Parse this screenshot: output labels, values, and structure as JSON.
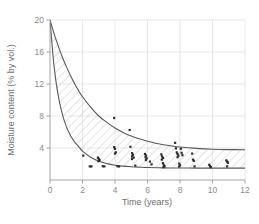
{
  "chart_data": {
    "type": "line",
    "title": "",
    "xlabel": "Time (years)",
    "ylabel": "Moisture content (% by vol.)",
    "xlim": [
      0,
      12
    ],
    "ylim": [
      0,
      20
    ],
    "xticks": [
      0,
      2,
      4,
      6,
      8,
      10,
      12
    ],
    "xtick_labels": [
      "0",
      "2",
      "4",
      "6",
      "8",
      "10",
      "12"
    ],
    "yticks": [
      0,
      4,
      8,
      12,
      16,
      20
    ],
    "ytick_labels": [
      "",
      "4",
      "8",
      "12",
      "16",
      "20"
    ],
    "grid": true,
    "legend": "none",
    "band_fill": "hatched",
    "series": [
      {
        "name": "upper bound",
        "type": "line",
        "color": "#595959",
        "x": [
          0,
          0.25,
          0.5,
          0.75,
          1,
          1.25,
          1.5,
          1.75,
          2,
          2.5,
          3,
          3.5,
          4,
          4.5,
          5,
          5.5,
          6,
          6.5,
          7,
          7.5,
          8,
          9,
          10,
          11,
          12
        ],
        "y": [
          20.0,
          18.3,
          16.8,
          15.4,
          14.2,
          13.1,
          12.1,
          11.2,
          10.4,
          9.1,
          8.0,
          7.2,
          6.5,
          5.95,
          5.5,
          5.15,
          4.85,
          4.6,
          4.4,
          4.25,
          4.12,
          3.95,
          3.85,
          3.8,
          3.78
        ]
      },
      {
        "name": "lower bound",
        "type": "line",
        "color": "#595959",
        "x": [
          0,
          0.25,
          0.5,
          0.75,
          1,
          1.25,
          1.5,
          1.75,
          2,
          2.5,
          3,
          3.5,
          4,
          4.5,
          5,
          5.5,
          6,
          7,
          8,
          9,
          10,
          11,
          12
        ],
        "y": [
          20.0,
          14.2,
          10.6,
          8.3,
          6.7,
          5.6,
          4.8,
          4.2,
          3.6,
          2.85,
          2.35,
          2.05,
          1.85,
          1.73,
          1.65,
          1.6,
          1.56,
          1.52,
          1.5,
          1.49,
          1.48,
          1.48,
          1.48
        ]
      },
      {
        "name": "measurements",
        "type": "scatter",
        "color": "#2b2b2b",
        "points": [
          [
            2.05,
            3.05
          ],
          [
            2.45,
            1.7
          ],
          [
            2.55,
            1.7
          ],
          [
            2.95,
            2.8
          ],
          [
            3.0,
            2.65
          ],
          [
            3.05,
            2.5
          ],
          [
            2.98,
            2.35
          ],
          [
            3.25,
            1.72
          ],
          [
            3.35,
            1.7
          ],
          [
            3.95,
            7.75
          ],
          [
            3.95,
            4.1
          ],
          [
            4.0,
            3.9
          ],
          [
            4.05,
            3.45
          ],
          [
            4.0,
            3.3
          ],
          [
            4.15,
            1.72
          ],
          [
            4.25,
            1.7
          ],
          [
            4.9,
            6.25
          ],
          [
            4.95,
            4.15
          ],
          [
            5.05,
            3.35
          ],
          [
            5.1,
            3.15
          ],
          [
            5.05,
            2.95
          ],
          [
            5.15,
            2.8
          ],
          [
            5.05,
            2.62
          ],
          [
            5.25,
            1.8
          ],
          [
            5.85,
            3.25
          ],
          [
            5.9,
            3.05
          ],
          [
            5.88,
            2.85
          ],
          [
            5.95,
            2.7
          ],
          [
            5.9,
            2.5
          ],
          [
            6.15,
            2.3
          ],
          [
            6.25,
            1.95
          ],
          [
            6.85,
            3.2
          ],
          [
            6.9,
            2.95
          ],
          [
            6.95,
            2.75
          ],
          [
            6.88,
            2.55
          ],
          [
            6.95,
            2.1
          ],
          [
            7.0,
            1.9
          ],
          [
            7.05,
            1.72
          ],
          [
            6.98,
            1.6
          ],
          [
            7.7,
            4.65
          ],
          [
            7.75,
            3.95
          ],
          [
            7.8,
            3.45
          ],
          [
            7.85,
            3.25
          ],
          [
            7.9,
            3.05
          ],
          [
            7.85,
            2.85
          ],
          [
            7.95,
            2.05
          ],
          [
            8.0,
            1.85
          ],
          [
            7.95,
            1.68
          ],
          [
            8.05,
            3.9
          ],
          [
            8.1,
            3.4
          ],
          [
            8.15,
            3.1
          ],
          [
            8.75,
            3.3
          ],
          [
            8.8,
            2.55
          ],
          [
            8.85,
            2.4
          ],
          [
            8.9,
            1.7
          ],
          [
            9.8,
            1.9
          ],
          [
            9.85,
            1.72
          ],
          [
            9.9,
            1.6
          ],
          [
            10.85,
            2.45
          ],
          [
            10.9,
            2.3
          ],
          [
            10.95,
            2.15
          ],
          [
            10.9,
            1.7
          ]
        ]
      }
    ]
  },
  "colors": {
    "curve": "#595959",
    "point": "#2b2b2b",
    "grid": "#d9d9d9",
    "axis": "#9a9a9a",
    "hatch": "#bdbdbd",
    "tick_text": "#8a8a8a",
    "axis_title": "#6e6e6e",
    "background": "#ffffff"
  }
}
